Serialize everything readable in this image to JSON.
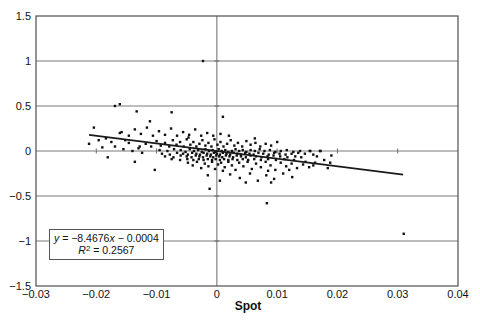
{
  "figure": {
    "background": "#ffffff"
  },
  "chart_data": {
    "type": "scatter",
    "title": "",
    "xlabel": "Spot",
    "ylabel": "",
    "xlim": [
      -0.03,
      0.04
    ],
    "ylim": [
      -1.5,
      1.5
    ],
    "grid": "horizontal-major",
    "legend": "none",
    "x_ticks": {
      "values": [
        -0.03,
        -0.02,
        -0.01,
        0,
        0.01,
        0.02,
        0.03,
        0.04
      ],
      "labels": [
        "−0.03",
        "−0.02",
        "−0.01",
        "0",
        "0.01",
        "0.02",
        "0.03",
        "0.04"
      ]
    },
    "y_ticks": {
      "values": [
        1.5,
        1,
        0.5,
        0,
        -0.5,
        -1,
        -1.5
      ],
      "labels": [
        "1.5",
        "1",
        "0.5",
        "0",
        "−0.5",
        "−1",
        "−1.5"
      ]
    },
    "gridline_y_values": [
      1,
      0.5,
      0,
      -0.5,
      -1
    ],
    "axis_cross": {
      "x": 0,
      "y": 0,
      "x_axis_tick_values": [
        -0.02,
        -0.01,
        0.01,
        0.02,
        0.03
      ],
      "y_axis_tick_values": [
        1,
        0.5,
        -0.5,
        -1
      ]
    },
    "colors": {
      "gridline": "#7a7a7a",
      "axis": "#6b6b6b",
      "border": "#4f4f4f",
      "marker": "#101010",
      "trendline": "#1a1a1a",
      "text": "#111111"
    },
    "marker": {
      "shape": "square",
      "size_px": 2.4
    },
    "trendline": {
      "slope": -8.4676,
      "intercept": -0.0004,
      "x_start": -0.0212,
      "x_end": 0.0309,
      "width_px": 1.6
    },
    "equation_box": {
      "line1": {
        "y": "y",
        "eq": " = −8.4676",
        "x": "x",
        "rest": " − 0.0004"
      },
      "line2": {
        "r": "R",
        "sup": "2",
        "rest": " = 0.2567"
      }
    },
    "points": [
      [
        -0.0095,
        0.01
      ],
      [
        -0.0082,
        0.0
      ],
      [
        -0.0071,
        0.02
      ],
      [
        -0.006,
        0.01
      ],
      [
        -0.0052,
        -0.01
      ],
      [
        -0.0045,
        0.02
      ],
      [
        -0.0038,
        0.0
      ],
      [
        -0.0031,
        0.01
      ],
      [
        -0.0025,
        -0.01
      ],
      [
        -0.0019,
        0.02
      ],
      [
        -0.0013,
        0.0
      ],
      [
        -0.0007,
        0.01
      ],
      [
        -0.0002,
        -0.01
      ],
      [
        0.0003,
        0.02
      ],
      [
        0.0008,
        0.0
      ],
      [
        0.0014,
        0.01
      ],
      [
        0.0019,
        -0.01
      ],
      [
        0.0025,
        0.0
      ],
      [
        0.0031,
        0.02
      ],
      [
        0.0037,
        0.0
      ],
      [
        0.0043,
        0.01
      ],
      [
        0.0049,
        -0.01
      ],
      [
        0.0056,
        0.01
      ],
      [
        0.0063,
        0.0
      ],
      [
        0.0071,
        0.02
      ],
      [
        0.0079,
        0.0
      ],
      [
        0.0088,
        0.01
      ],
      [
        0.0097,
        -0.01
      ],
      [
        0.0106,
        0.0
      ],
      [
        0.0116,
        0.01
      ],
      [
        0.0127,
        -0.01
      ],
      [
        0.0138,
        0.0
      ],
      [
        0.0154,
        0.0
      ],
      [
        0.0171,
        0.0
      ],
      [
        -0.0091,
        -0.03
      ],
      [
        -0.0078,
        -0.04
      ],
      [
        -0.0066,
        -0.02
      ],
      [
        -0.0056,
        -0.03
      ],
      [
        -0.0048,
        -0.04
      ],
      [
        -0.0041,
        -0.02
      ],
      [
        -0.0034,
        -0.03
      ],
      [
        -0.0028,
        -0.04
      ],
      [
        -0.0022,
        -0.02
      ],
      [
        -0.0016,
        -0.03
      ],
      [
        -0.001,
        -0.04
      ],
      [
        -0.0005,
        -0.02
      ],
      [
        0.0,
        -0.03
      ],
      [
        0.0005,
        -0.04
      ],
      [
        0.001,
        -0.02
      ],
      [
        0.0016,
        -0.03
      ],
      [
        0.0022,
        -0.04
      ],
      [
        0.0028,
        -0.02
      ],
      [
        0.0034,
        -0.03
      ],
      [
        0.004,
        -0.04
      ],
      [
        0.0047,
        -0.02
      ],
      [
        0.0054,
        -0.03
      ],
      [
        0.0061,
        -0.04
      ],
      [
        0.0069,
        -0.02
      ],
      [
        0.0077,
        -0.03
      ],
      [
        0.0086,
        -0.04
      ],
      [
        0.0095,
        -0.02
      ],
      [
        0.0104,
        -0.03
      ],
      [
        0.0114,
        -0.04
      ],
      [
        0.0124,
        -0.03
      ],
      [
        0.0135,
        -0.02
      ],
      [
        0.0146,
        -0.03
      ],
      [
        0.016,
        -0.04
      ],
      [
        -0.0086,
        -0.06
      ],
      [
        -0.0072,
        -0.07
      ],
      [
        -0.006,
        -0.05
      ],
      [
        -0.005,
        -0.06
      ],
      [
        -0.0042,
        -0.07
      ],
      [
        -0.0035,
        -0.05
      ],
      [
        -0.0029,
        -0.06
      ],
      [
        -0.0023,
        -0.07
      ],
      [
        -0.0017,
        -0.05
      ],
      [
        -0.0011,
        -0.06
      ],
      [
        -0.0006,
        -0.07
      ],
      [
        -0.0001,
        -0.05
      ],
      [
        0.0004,
        -0.06
      ],
      [
        0.0009,
        -0.07
      ],
      [
        0.0015,
        -0.05
      ],
      [
        0.0021,
        -0.06
      ],
      [
        0.0027,
        -0.07
      ],
      [
        0.0033,
        -0.05
      ],
      [
        0.004,
        -0.06
      ],
      [
        0.0048,
        -0.07
      ],
      [
        0.0056,
        -0.05
      ],
      [
        0.0065,
        -0.06
      ],
      [
        0.0074,
        -0.07
      ],
      [
        0.0084,
        -0.06
      ],
      [
        0.0094,
        -0.05
      ],
      [
        0.0105,
        -0.06
      ],
      [
        0.0117,
        -0.07
      ],
      [
        0.013,
        -0.06
      ],
      [
        -0.0075,
        -0.09
      ],
      [
        -0.0061,
        -0.1
      ],
      [
        -0.0049,
        -0.09
      ],
      [
        -0.0039,
        -0.1
      ],
      [
        -0.003,
        -0.09
      ],
      [
        -0.0022,
        -0.1
      ],
      [
        -0.0015,
        -0.09
      ],
      [
        -0.0008,
        -0.1
      ],
      [
        -0.0002,
        -0.09
      ],
      [
        0.0005,
        -0.1
      ],
      [
        0.0012,
        -0.09
      ],
      [
        0.0019,
        -0.1
      ],
      [
        0.0026,
        -0.09
      ],
      [
        0.0034,
        -0.1
      ],
      [
        0.0043,
        -0.09
      ],
      [
        0.0052,
        -0.1
      ],
      [
        0.0062,
        -0.09
      ],
      [
        0.0073,
        -0.1
      ],
      [
        0.0085,
        -0.09
      ],
      [
        0.0098,
        -0.1
      ],
      [
        0.0112,
        -0.09
      ],
      [
        0.0128,
        -0.1
      ],
      [
        -0.0128,
        0.05
      ],
      [
        -0.0118,
        0.08
      ],
      [
        -0.0109,
        0.05
      ],
      [
        -0.01,
        0.11
      ],
      [
        -0.0093,
        0.06
      ],
      [
        -0.0086,
        0.09
      ],
      [
        -0.0079,
        0.05
      ],
      [
        -0.0073,
        0.12
      ],
      [
        -0.0067,
        0.07
      ],
      [
        -0.0061,
        0.1
      ],
      [
        -0.0055,
        0.05
      ],
      [
        -0.005,
        0.13
      ],
      [
        -0.0044,
        0.07
      ],
      [
        -0.0039,
        0.1
      ],
      [
        -0.0034,
        0.05
      ],
      [
        -0.0029,
        0.08
      ],
      [
        -0.0024,
        0.12
      ],
      [
        -0.0019,
        0.06
      ],
      [
        -0.0014,
        0.09
      ],
      [
        -0.0009,
        0.05
      ],
      [
        -0.0004,
        0.13
      ],
      [
        0.0001,
        0.07
      ],
      [
        0.0006,
        0.1
      ],
      [
        0.0011,
        0.05
      ],
      [
        0.0017,
        0.08
      ],
      [
        0.0023,
        0.12
      ],
      [
        0.0029,
        0.06
      ],
      [
        0.0035,
        0.09
      ],
      [
        0.0042,
        0.05
      ],
      [
        0.0049,
        0.11
      ],
      [
        0.0056,
        0.07
      ],
      [
        0.0064,
        0.09
      ],
      [
        0.0072,
        0.05
      ],
      [
        0.0081,
        0.08
      ],
      [
        0.009,
        0.06
      ],
      [
        0.01,
        0.1
      ],
      [
        0.0063,
        0.14
      ],
      [
        -0.0047,
        0.15
      ],
      [
        -0.0048,
        -0.13
      ],
      [
        -0.004,
        -0.16
      ],
      [
        -0.0033,
        -0.12
      ],
      [
        -0.0026,
        -0.19
      ],
      [
        -0.002,
        -0.14
      ],
      [
        -0.0014,
        -0.17
      ],
      [
        -0.0008,
        -0.12
      ],
      [
        -0.0003,
        -0.2
      ],
      [
        0.0002,
        -0.15
      ],
      [
        0.0007,
        -0.13
      ],
      [
        0.0013,
        -0.18
      ],
      [
        0.0019,
        -0.12
      ],
      [
        0.0025,
        -0.16
      ],
      [
        0.0031,
        -0.21
      ],
      [
        0.0037,
        -0.13
      ],
      [
        0.0044,
        -0.17
      ],
      [
        0.0051,
        -0.12
      ],
      [
        0.0058,
        -0.2
      ],
      [
        0.0065,
        -0.14
      ],
      [
        0.0073,
        -0.18
      ],
      [
        0.0081,
        -0.12
      ],
      [
        0.0089,
        -0.16
      ],
      [
        0.0097,
        -0.21
      ],
      [
        0.0106,
        -0.13
      ],
      [
        0.0115,
        -0.17
      ],
      [
        0.0124,
        -0.14
      ],
      [
        0.0133,
        -0.19
      ],
      [
        0.0143,
        -0.15
      ],
      [
        0.0153,
        -0.18
      ],
      [
        0.0163,
        -0.13
      ],
      [
        0.001,
        -0.22
      ],
      [
        0.0085,
        -0.22
      ],
      [
        0.012,
        -0.21
      ],
      [
        -0.0015,
        -0.27
      ],
      [
        0.0005,
        -0.33
      ],
      [
        0.0022,
        -0.26
      ],
      [
        0.0038,
        -0.3
      ],
      [
        0.0055,
        -0.25
      ],
      [
        0.0068,
        -0.33
      ],
      [
        0.0082,
        -0.27
      ],
      [
        0.0095,
        -0.31
      ],
      [
        0.011,
        -0.25
      ],
      [
        0.0125,
        -0.29
      ],
      [
        0.0048,
        -0.35
      ],
      [
        0.009,
        -0.35
      ],
      [
        -0.0158,
        0.21
      ],
      [
        -0.0146,
        0.17
      ],
      [
        -0.0136,
        0.24
      ],
      [
        -0.0126,
        0.19
      ],
      [
        -0.0116,
        0.26
      ],
      [
        -0.0106,
        0.17
      ],
      [
        -0.0096,
        0.22
      ],
      [
        -0.0086,
        0.18
      ],
      [
        -0.0076,
        0.25
      ],
      [
        -0.0066,
        0.17
      ],
      [
        -0.0056,
        0.21
      ],
      [
        -0.0046,
        0.18
      ],
      [
        -0.0036,
        0.24
      ],
      [
        -0.0026,
        0.17
      ],
      [
        -0.0016,
        0.2
      ],
      [
        -0.0006,
        0.17
      ],
      [
        0.0006,
        0.19
      ],
      [
        0.002,
        0.17
      ],
      [
        -0.0212,
        0.08
      ],
      [
        -0.0204,
        0.26
      ],
      [
        -0.0196,
        0.12
      ],
      [
        -0.019,
        0.04
      ],
      [
        -0.0184,
        0.14
      ],
      [
        -0.0181,
        -0.07
      ],
      [
        -0.0175,
        0.1
      ],
      [
        -0.0169,
        0.05
      ],
      [
        -0.0161,
        0.2
      ],
      [
        -0.0155,
        0.02
      ],
      [
        -0.0152,
        0.12
      ],
      [
        -0.0146,
        0.09
      ],
      [
        -0.014,
        0.0
      ],
      [
        -0.0136,
        -0.12
      ],
      [
        -0.013,
        0.03
      ],
      [
        -0.0124,
        -0.02
      ],
      [
        -0.0103,
        -0.21
      ],
      [
        0.014,
        -0.07
      ],
      [
        0.0147,
        -0.12
      ],
      [
        0.0155,
        0.0
      ],
      [
        0.016,
        -0.16
      ],
      [
        0.0166,
        -0.06
      ],
      [
        0.0172,
        0.0
      ],
      [
        0.0178,
        -0.1
      ],
      [
        0.0184,
        -0.19
      ],
      [
        0.019,
        -0.05
      ],
      [
        0.0188,
        -0.13
      ],
      [
        -0.0023,
        1.0
      ],
      [
        -0.0169,
        0.5
      ],
      [
        -0.0161,
        0.52
      ],
      [
        -0.0133,
        0.44
      ],
      [
        -0.0075,
        0.43
      ],
      [
        0.001,
        0.38
      ],
      [
        -0.0111,
        0.33
      ],
      [
        -0.0012,
        -0.42
      ],
      [
        0.0083,
        -0.58
      ],
      [
        0.031,
        -0.92
      ]
    ]
  }
}
